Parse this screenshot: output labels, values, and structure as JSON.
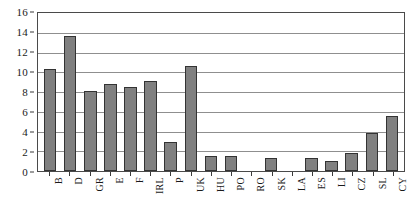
{
  "chart_data": {
    "type": "bar",
    "title": "",
    "subtitle": "",
    "xlabel": "",
    "ylabel": "",
    "ylim": [
      0,
      16
    ],
    "ytick_step": 2,
    "yticks": [
      0,
      2,
      4,
      6,
      8,
      10,
      12,
      14,
      16
    ],
    "grid": true,
    "grid_axis": "y",
    "legend": false,
    "legend_position": "none",
    "categories": [
      "B",
      "D",
      "GR",
      "E",
      "F",
      "IRL",
      "P",
      "UK",
      "HU",
      "PO",
      "RO",
      "SK",
      "LA",
      "ES",
      "LI",
      "CZ",
      "SL",
      "CY"
    ],
    "values": [
      10.3,
      13.7,
      8.1,
      8.8,
      8.5,
      9.1,
      2.9,
      10.6,
      1.5,
      1.5,
      0,
      1.3,
      0,
      1.3,
      1.0,
      1.8,
      3.9,
      5.6
    ],
    "series": [
      {
        "name": "",
        "values": [
          10.3,
          13.7,
          8.1,
          8.8,
          8.5,
          9.1,
          2.9,
          10.6,
          1.5,
          1.5,
          0,
          1.3,
          0,
          1.3,
          1.0,
          1.8,
          3.9,
          5.6
        ]
      }
    ],
    "annotations": []
  },
  "style": {
    "bar_fill": "#808080",
    "bar_border": "#333333",
    "grid_color": "#8f8f8f",
    "frame_color": "#4a4a4a",
    "background": "#ffffff",
    "text_color": "#1a1a1a"
  }
}
